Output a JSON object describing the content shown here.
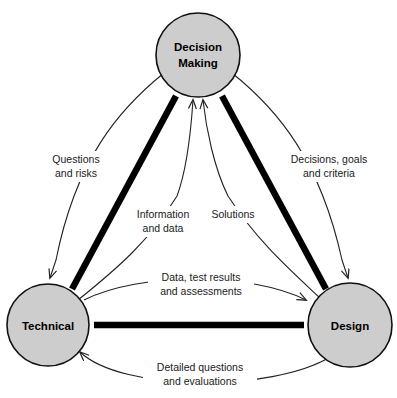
{
  "diagram": {
    "canvas": {
      "width": 397,
      "height": 398,
      "background": "#ffffff"
    },
    "style": {
      "node_fill": "#cdcdcd",
      "node_stroke": "#111111",
      "thin_edge_color": "#222222",
      "thick_edge_color": "#000000",
      "label_color": "#1a1a1a"
    },
    "nodes": [
      {
        "id": "decision-making",
        "label_line1": "Decision",
        "label_line2": "Making",
        "cx": 198,
        "cy": 55,
        "r": 42
      },
      {
        "id": "technical",
        "label_line1": "Technical",
        "label_line2": "",
        "cx": 48,
        "cy": 325,
        "r": 41
      },
      {
        "id": "design",
        "label_line1": "Design",
        "label_line2": "",
        "cx": 350,
        "cy": 325,
        "r": 42
      }
    ],
    "edge_labels": [
      {
        "id": "questions-and-risks",
        "line1": "Questions",
        "line2": "and risks",
        "x": 76,
        "y": 164
      },
      {
        "id": "decisions-goals-and-criteria",
        "line1": "Decisions, goals",
        "line2": "and criteria",
        "x": 328,
        "y": 164
      },
      {
        "id": "information-and-data",
        "line1": "Information",
        "line2": "and data",
        "x": 160,
        "y": 218
      },
      {
        "id": "solutions",
        "line1": "Solutions",
        "line2": "",
        "x": 230,
        "y": 218
      },
      {
        "id": "data-test-results-and-assessments",
        "line1": "Data, test results",
        "line2": "and assessments",
        "x": 199,
        "y": 281
      },
      {
        "id": "detailed-questions-and-evaluations",
        "line1": "Detailed questions",
        "line2": "and evaluations",
        "x": 199,
        "y": 371
      }
    ]
  }
}
